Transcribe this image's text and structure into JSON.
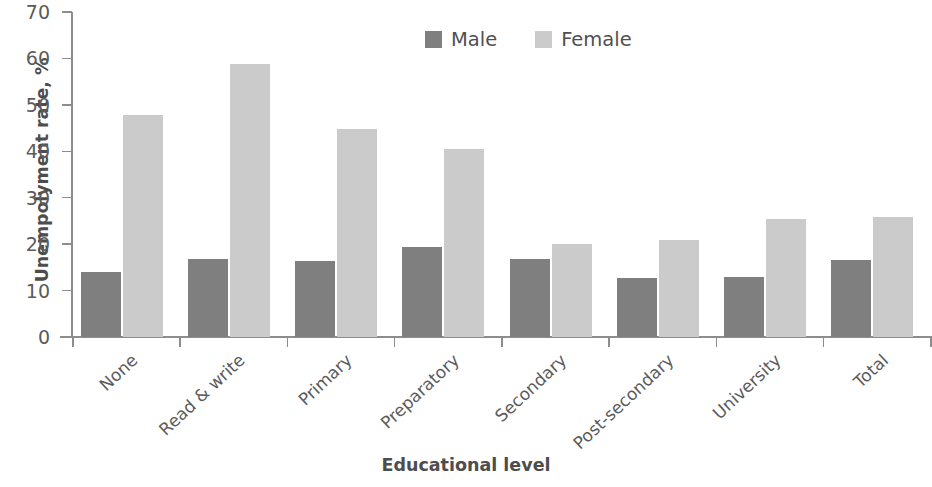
{
  "chart_data": {
    "type": "bar",
    "title": "",
    "xlabel": "Educational level",
    "ylabel": "Unempolyment rate, %",
    "categories": [
      "None",
      "Read & write",
      "Primary",
      "Preparatory",
      "Secondary",
      "Post-secondary",
      "University",
      "Total"
    ],
    "series": [
      {
        "name": "Male",
        "color": "#7f7f7f",
        "values": [
          14.1,
          16.8,
          16.3,
          19.3,
          16.7,
          12.8,
          13.0,
          16.6
        ]
      },
      {
        "name": "Female",
        "color": "#cbcbcb",
        "values": [
          47.8,
          58.8,
          44.8,
          40.4,
          20.1,
          20.8,
          25.4,
          25.9
        ]
      }
    ],
    "ylim": [
      0,
      70
    ],
    "ytick_values": [
      0,
      10,
      20,
      30,
      40,
      50,
      60,
      70
    ],
    "ytick_labels": [
      "0",
      "10",
      "20",
      "30",
      "40",
      "50",
      "60",
      "70"
    ],
    "grid": false,
    "legend_position": "top-center",
    "legend_entries": [
      "Male",
      "Female"
    ]
  }
}
